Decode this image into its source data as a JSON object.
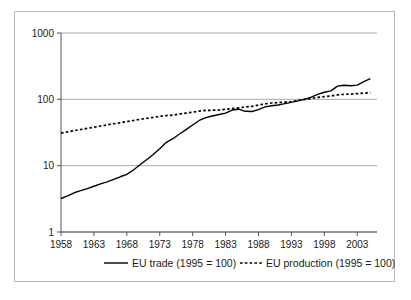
{
  "chart_data": {
    "type": "line",
    "title": "",
    "subtitle": "",
    "xlabel": "",
    "ylabel": "",
    "yscale": "log",
    "ylim": [
      1,
      1000
    ],
    "xlim": [
      1958,
      2006
    ],
    "grid": "horizontal",
    "legend_position": "bottom",
    "ytick_labels": [
      "1000",
      "100",
      "10",
      "1"
    ],
    "ytick_values": [
      1000,
      100,
      10,
      1
    ],
    "xtick_labels": [
      "1958",
      "1963",
      "1968",
      "1973",
      "1978",
      "1983",
      "1988",
      "1993",
      "1998",
      "2003"
    ],
    "xtick_values": [
      1958,
      1963,
      1968,
      1973,
      1978,
      1983,
      1988,
      1993,
      1998,
      2003
    ],
    "x": [
      1958,
      1959,
      1960,
      1961,
      1962,
      1963,
      1964,
      1965,
      1966,
      1967,
      1968,
      1969,
      1970,
      1971,
      1972,
      1973,
      1974,
      1975,
      1976,
      1977,
      1978,
      1979,
      1980,
      1981,
      1982,
      1983,
      1984,
      1985,
      1986,
      1987,
      1988,
      1989,
      1990,
      1991,
      1992,
      1993,
      1994,
      1995,
      1996,
      1997,
      1998,
      1999,
      2000,
      2001,
      2002,
      2003,
      2004,
      2005
    ],
    "series": [
      {
        "name": "EU  trade (1995 = 100)",
        "style": "solid",
        "color": "#000000",
        "values": [
          3.2,
          3.5,
          3.9,
          4.2,
          4.5,
          4.9,
          5.3,
          5.7,
          6.2,
          6.8,
          7.4,
          8.6,
          10.3,
          12.3,
          14.7,
          18.0,
          22.5,
          25.5,
          30.0,
          35.0,
          41.0,
          48.0,
          53.0,
          56.0,
          59.0,
          62.0,
          69.0,
          71.0,
          66.0,
          65.5,
          70.0,
          77.0,
          80.0,
          82.0,
          86.0,
          90.0,
          95.0,
          100.0,
          108.0,
          119.0,
          128.0,
          134.0,
          158.0,
          163.0,
          160.0,
          164.0,
          185.0,
          205.0
        ]
      },
      {
        "name": "EU production (1995 = 100)",
        "style": "dotted",
        "color": "#000000",
        "values": [
          31.0,
          32.3,
          33.7,
          35.1,
          36.5,
          38.0,
          39.6,
          41.2,
          42.8,
          44.4,
          46.2,
          48.0,
          49.9,
          51.6,
          53.4,
          55.5,
          57.0,
          57.8,
          60.0,
          62.0,
          64.0,
          66.5,
          68.0,
          68.5,
          69.0,
          70.5,
          72.5,
          74.5,
          76.5,
          78.5,
          82.0,
          85.5,
          88.0,
          89.5,
          91.0,
          92.5,
          96.0,
          100.0,
          103.0,
          107.0,
          110.0,
          112.0,
          117.0,
          119.0,
          120.0,
          122.0,
          124.0,
          126.0
        ]
      }
    ],
    "legend": [
      {
        "label": "EU  trade (1995 = 100)",
        "style": "solid"
      },
      {
        "label": "EU production (1995 = 100)",
        "style": "dotted"
      }
    ]
  },
  "colors": {
    "line": "#000000",
    "grid": "#a8a8a8",
    "axis": "#555555",
    "frame": "#b9b9b9",
    "background": "#ffffff",
    "text": "#1a1a1a"
  }
}
